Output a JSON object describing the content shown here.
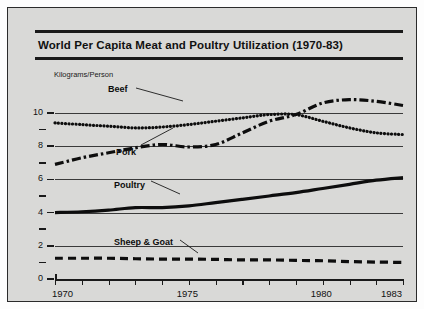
{
  "card": {
    "title": "World Per Capita Meat and Poultry Utilization (1970-83)",
    "background_color": "#d9d9d7",
    "border_color": "#2b2b2b",
    "ink_color": "#1a1a1a"
  },
  "chart_data": {
    "type": "line",
    "title": "World Per Capita Meat and Poultry Utilization (1970-83)",
    "xlabel": "",
    "ylabel": "Kilograms/Person",
    "xlim": [
      1970,
      1983
    ],
    "ylim": [
      0,
      10.9
    ],
    "grid": true,
    "gridlines_y": [
      2,
      4,
      6,
      8,
      10
    ],
    "legend_position": "inline-labels",
    "y_ticks_major": [
      0,
      2,
      4,
      6,
      8,
      10
    ],
    "y_ticks_minor": [
      1,
      3,
      5,
      7,
      9
    ],
    "y_tick_labels": [
      "0",
      "2",
      "4",
      "6",
      "8",
      "10"
    ],
    "x_ticks": [
      1970,
      1971,
      1972,
      1973,
      1974,
      1975,
      1976,
      1977,
      1978,
      1979,
      1980,
      1981,
      1982,
      1983
    ],
    "x_tick_labels_shown": [
      "1970",
      "1975",
      "1980",
      "1983"
    ],
    "x": [
      1970,
      1971,
      1972,
      1973,
      1974,
      1975,
      1976,
      1977,
      1978,
      1979,
      1980,
      1981,
      1982,
      1983
    ],
    "series": [
      {
        "name": "Beef",
        "style": "dotted",
        "values": [
          9.4,
          9.3,
          9.2,
          9.1,
          9.15,
          9.3,
          9.5,
          9.7,
          9.9,
          9.9,
          9.5,
          9.1,
          8.8,
          8.7
        ]
      },
      {
        "name": "Pork",
        "style": "dash-dot",
        "values": [
          6.9,
          7.3,
          7.6,
          7.9,
          8.1,
          7.95,
          8.1,
          8.8,
          9.5,
          9.9,
          10.6,
          10.8,
          10.7,
          10.45
        ]
      },
      {
        "name": "Poultry",
        "style": "solid",
        "values": [
          4.0,
          4.05,
          4.15,
          4.3,
          4.3,
          4.4,
          4.6,
          4.8,
          5.0,
          5.2,
          5.45,
          5.7,
          5.95,
          6.1
        ]
      },
      {
        "name": "Sheep & Goat",
        "style": "dashed",
        "values": [
          1.25,
          1.25,
          1.25,
          1.22,
          1.2,
          1.2,
          1.18,
          1.15,
          1.15,
          1.12,
          1.1,
          1.05,
          1.02,
          1.0
        ]
      }
    ],
    "annotations": [
      {
        "label": "Beef",
        "x_px": 100,
        "y_px": 76
      },
      {
        "label": "Pork",
        "x_px": 108,
        "y_px": 139
      },
      {
        "label": "Poultry",
        "x_px": 106,
        "y_px": 172
      },
      {
        "label": "Sheep & Goat",
        "x_px": 106,
        "y_px": 229
      }
    ]
  }
}
